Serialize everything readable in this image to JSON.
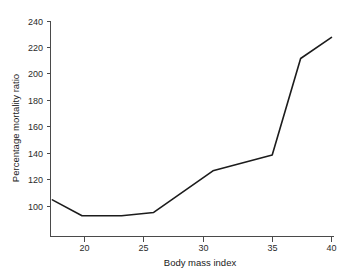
{
  "chart_data": {
    "type": "line",
    "title": "",
    "subtitle": "",
    "xlabel": "Body mass index",
    "ylabel": "Percentage mortality ratio",
    "xlim": [
      16.6,
      40.6
    ],
    "ylim": [
      80,
      246
    ],
    "xticks": [
      20,
      25,
      30,
      35,
      40
    ],
    "yticks": [
      100,
      120,
      140,
      160,
      180,
      200,
      220,
      240
    ],
    "xtick_labels": [
      "20",
      "25",
      "30",
      "35",
      "40"
    ],
    "ytick_labels": [
      "100",
      "120",
      "140",
      "160",
      "180",
      "200",
      "220",
      "240"
    ],
    "grid": false,
    "legend": false,
    "legend_position": "none",
    "line_color": "#1c1c1c",
    "axis_color": "#4a4a4a",
    "background_color": "#ffffff",
    "series": [
      {
        "name": "Percentage mortality ratio",
        "x": [
          17.4,
          19.8,
          23.0,
          25.6,
          30.4,
          35.2,
          37.5,
          40.0
        ],
        "values": [
          105,
          93,
          93,
          95.5,
          127,
          139,
          212,
          228
        ]
      }
    ]
  },
  "axes": {
    "x_title": "Body mass index",
    "y_title": "Percentage mortality ratio"
  }
}
